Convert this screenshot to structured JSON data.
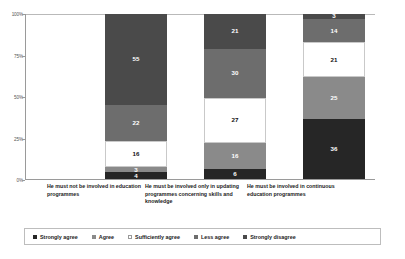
{
  "chart_data": {
    "type": "bar",
    "title": "",
    "subtitle": "",
    "xlabel": "",
    "ylabel": "",
    "stacked": true,
    "stack_mode": "percent",
    "grid": false,
    "legend_position": "bottom",
    "ylim": [
      0,
      100
    ],
    "ytick_labels": [
      "0%",
      "25%",
      "50%",
      "75%",
      "100%"
    ],
    "ytick_values": [
      0,
      25,
      50,
      75,
      100
    ],
    "categories": [
      "He must not be involved in education programmes",
      "He must be involved only in updating programmes concerning skills and knowledge",
      "He must be involved in continuous education programmes"
    ],
    "series": [
      {
        "name": "Strongly agree",
        "color": "#262626",
        "values": [
          4,
          6,
          36
        ]
      },
      {
        "name": "Agree",
        "color": "#8a8a8a",
        "values": [
          3,
          16,
          25
        ]
      },
      {
        "name": "Sufficiently agree",
        "color": "#ffffff",
        "values": [
          16,
          27,
          21
        ]
      },
      {
        "name": "Less agree",
        "color": "#6d6d6d",
        "values": [
          22,
          30,
          14
        ]
      },
      {
        "name": "Strongly disagree",
        "color": "#4a4a4a",
        "values": [
          55,
          21,
          3
        ]
      }
    ]
  },
  "legend": {
    "items": [
      {
        "label": "Strongly agree",
        "color": "#262626"
      },
      {
        "label": "Agree",
        "color": "#8a8a8a"
      },
      {
        "label": "Sufficiently agree",
        "color": "#ffffff"
      },
      {
        "label": "Less agree",
        "color": "#6d6d6d"
      },
      {
        "label": "Strongly disagree",
        "color": "#4a4a4a"
      }
    ]
  }
}
